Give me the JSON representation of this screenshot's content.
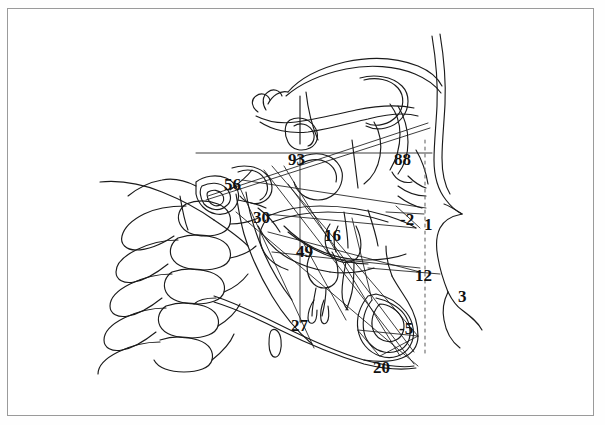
{
  "figure": {
    "type": "line-drawing",
    "background_color": "#ffffff",
    "ink_color": "#1a1a1a",
    "frame_color": "#9a9a9a",
    "width": 605,
    "height": 425
  },
  "measurements": [
    {
      "id": "m-93",
      "value": "93",
      "x": 288,
      "y": 151,
      "note": "upper-mid cranial angle"
    },
    {
      "id": "m-88",
      "value": "88",
      "x": 394,
      "y": 151,
      "note": "anterior cranial angle"
    },
    {
      "id": "m-56",
      "value": "56",
      "x": 224,
      "y": 176,
      "note": "posterior cranial base"
    },
    {
      "id": "m-30",
      "value": "30",
      "x": 253,
      "y": 209,
      "note": "ramus region"
    },
    {
      "id": "m-16",
      "value": "16",
      "x": 324,
      "y": 227,
      "note": "maxillary region"
    },
    {
      "id": "m-minus2",
      "value": "-2",
      "x": 400,
      "y": 211,
      "note": "upper incisor relation"
    },
    {
      "id": "m-1",
      "value": "1",
      "x": 424,
      "y": 216,
      "note": "incisor value"
    },
    {
      "id": "m-49",
      "value": "49",
      "x": 296,
      "y": 243,
      "note": "mandibular plane angle"
    },
    {
      "id": "m-12",
      "value": "12",
      "x": 415,
      "y": 267,
      "note": "lower incisor relation"
    },
    {
      "id": "m-3",
      "value": "3",
      "x": 458,
      "y": 288,
      "note": "soft tissue chin"
    },
    {
      "id": "m-27",
      "value": "27",
      "x": 291,
      "y": 317,
      "note": "mandibular body"
    },
    {
      "id": "m-minus5",
      "value": "-5",
      "x": 399,
      "y": 320,
      "note": "chin position"
    },
    {
      "id": "m-20",
      "value": "20",
      "x": 373,
      "y": 359,
      "note": "symphysis angle"
    }
  ],
  "reference_lines": {
    "horizontal_label": "horizontal reference plane",
    "vertical_dotted_label": "vertical facial reference (dotted)",
    "vertical_solid_label": "vertical mid reference (solid)"
  }
}
